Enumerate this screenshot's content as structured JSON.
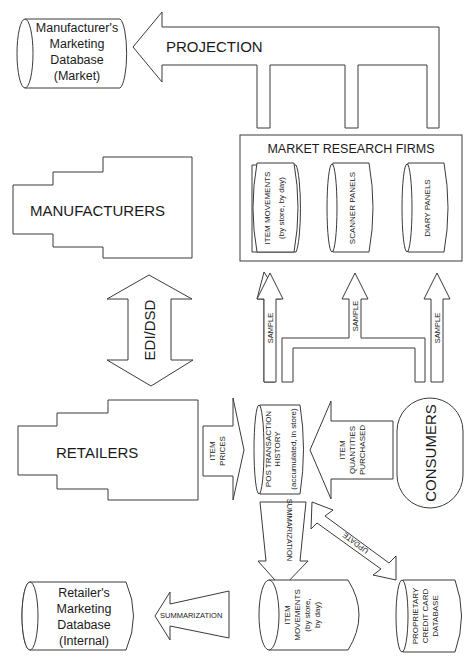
{
  "diagram": {
    "manufacturer_db": {
      "lines": [
        "Manufacturer's",
        "Marketing",
        "Database",
        "(Market)"
      ]
    },
    "projection_arrow": {
      "label": "PROJECTION"
    },
    "market_research": {
      "title": "MARKET RESEARCH FIRMS",
      "sources": [
        {
          "lines": [
            "ITEM MOVEMENTS",
            "(by store, by day)"
          ]
        },
        {
          "lines": [
            "SCANNER PANELS"
          ]
        },
        {
          "lines": [
            "DIARY PANELS"
          ]
        }
      ]
    },
    "manufacturers": {
      "label": "MANUFACTURERS"
    },
    "edi_arrow": {
      "label": "EDI/DSD"
    },
    "sample_arrows": [
      {
        "label": "SAMPLE"
      },
      {
        "label": "SAMPLE"
      },
      {
        "label": "SAMPLE"
      }
    ],
    "retailers": {
      "label": "RETAILERS"
    },
    "item_prices_arrow": {
      "lines": [
        "ITEM",
        "PRICES"
      ]
    },
    "pos_history": {
      "lines": [
        "POS TRANSACTION",
        "HISTORY",
        "(accumulated, in store)"
      ]
    },
    "item_quantities_arrow": {
      "lines": [
        "ITEM",
        "QUANTITIES",
        "PURCHASED"
      ]
    },
    "consumers": {
      "label": "CONSUMERS"
    },
    "summarization_down_arrow": {
      "label": "SUMMARIZATION"
    },
    "update_arrow": {
      "label": "UPDATE"
    },
    "item_movements_store": {
      "lines": [
        "ITEM",
        "MOVEMENTS",
        "(by store,",
        "by day)"
      ]
    },
    "credit_card_db": {
      "lines": [
        "PROPRIETARY",
        "CREDIT CARD",
        "DATABASE"
      ]
    },
    "summarization_left_arrow": {
      "label": "SUMMARIZATION"
    },
    "retailer_db": {
      "lines": [
        "Retailer's",
        "Marketing",
        "Database",
        "(Internal)"
      ]
    }
  }
}
